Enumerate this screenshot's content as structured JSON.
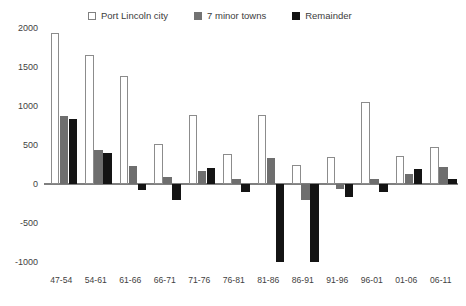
{
  "legend": {
    "entries": [
      {
        "label": "Port Lincoln city",
        "swatch": "legend-swatch-white",
        "color": "#ffffff"
      },
      {
        "label": "7 minor towns",
        "swatch": "legend-swatch-gray",
        "color": "#737373"
      },
      {
        "label": "Remainder",
        "swatch": "legend-swatch-black",
        "color": "#141414"
      }
    ]
  },
  "axes": {
    "y_ticks": [
      "2000",
      "1500",
      "1000",
      "500",
      "0",
      "-500",
      "-1000"
    ],
    "y_tick_values": [
      2000,
      1500,
      1000,
      500,
      0,
      -500,
      -1000
    ],
    "x_labels": [
      "47-54",
      "54-61",
      "61-66",
      "66-71",
      "71-76",
      "76-81",
      "81-86",
      "86-91",
      "91-96",
      "96-01",
      "01-06",
      "06-11"
    ]
  },
  "chart_data": {
    "type": "bar",
    "title": "",
    "subtitle": "",
    "xlabel": "",
    "ylabel": "",
    "ylim": [
      -1000,
      2000
    ],
    "ytick_step": 500,
    "grid": false,
    "legend_position": "top",
    "categories": [
      "47-54",
      "54-61",
      "61-66",
      "66-71",
      "71-76",
      "76-81",
      "81-86",
      "86-91",
      "91-96",
      "96-01",
      "01-06",
      "06-11"
    ],
    "series": [
      {
        "name": "Port Lincoln city",
        "color": "#ffffff",
        "values": [
          1930,
          1650,
          1390,
          510,
          880,
          390,
          880,
          250,
          340,
          1050,
          360,
          470
        ]
      },
      {
        "name": "7 minor towns",
        "color": "#737373",
        "values": [
          870,
          440,
          230,
          90,
          170,
          60,
          330,
          -210,
          -60,
          70,
          130,
          220
        ]
      },
      {
        "name": "Remainder",
        "color": "#141414",
        "values": [
          830,
          400,
          -80,
          -210,
          210,
          -100,
          -1000,
          -1000,
          -170,
          -100,
          190,
          60
        ]
      }
    ]
  }
}
